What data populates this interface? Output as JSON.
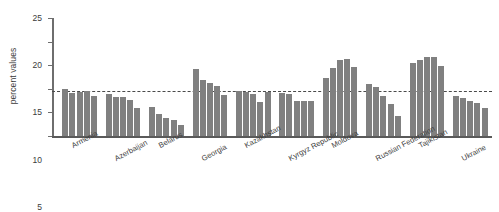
{
  "chart_data": {
    "type": "bar",
    "title": "",
    "xlabel": "",
    "ylabel": "percent values",
    "ylim": [
      0,
      25
    ],
    "yticks": [
      0,
      5,
      10,
      15,
      20,
      25
    ],
    "grid": false,
    "legend": "none",
    "bar_color": "#808080",
    "axis_color": "#6e6e6e",
    "reference_line": {
      "value": 9.5,
      "style": "dashed",
      "color": "#4a4a4a"
    },
    "categories": [
      "Armenia",
      "Azerbaijan",
      "Belarus",
      "Georgia",
      "Kazakhstan",
      "Kyrgyz Republic",
      "Moldova",
      "Russian Federation",
      "Tajikistan",
      "Ukraine"
    ],
    "bars_per_group": 5,
    "groups": [
      {
        "category": "Armenia",
        "values": [
          10.0,
          9.2,
          9.3,
          9.5,
          8.5
        ]
      },
      {
        "category": "Azerbaijan",
        "values": [
          8.8,
          8.2,
          8.3,
          7.7,
          6.0
        ]
      },
      {
        "category": "Belarus",
        "values": [
          6.2,
          4.6,
          3.9,
          3.3,
          2.3
        ]
      },
      {
        "category": "Georgia",
        "values": [
          14.3,
          11.8,
          11.2,
          10.5,
          8.7
        ]
      },
      {
        "category": "Kazakhstan",
        "values": [
          9.5,
          9.3,
          8.8,
          7.3,
          9.3
        ]
      },
      {
        "category": "Kyrgyz Republic",
        "values": [
          9.2,
          8.8,
          7.5,
          7.5,
          7.5
        ]
      },
      {
        "category": "Moldova",
        "values": [
          12.2,
          14.5,
          16.2,
          16.3,
          14.7
        ]
      },
      {
        "category": "Russian Federation",
        "values": [
          11.0,
          10.3,
          8.5,
          6.8,
          4.2
        ]
      },
      {
        "category": "Tajikistan",
        "values": [
          15.5,
          16.2,
          16.7,
          16.7,
          14.8
        ]
      },
      {
        "category": "Ukraine",
        "values": [
          8.5,
          8.0,
          7.5,
          7.0,
          6.0
        ]
      }
    ]
  }
}
